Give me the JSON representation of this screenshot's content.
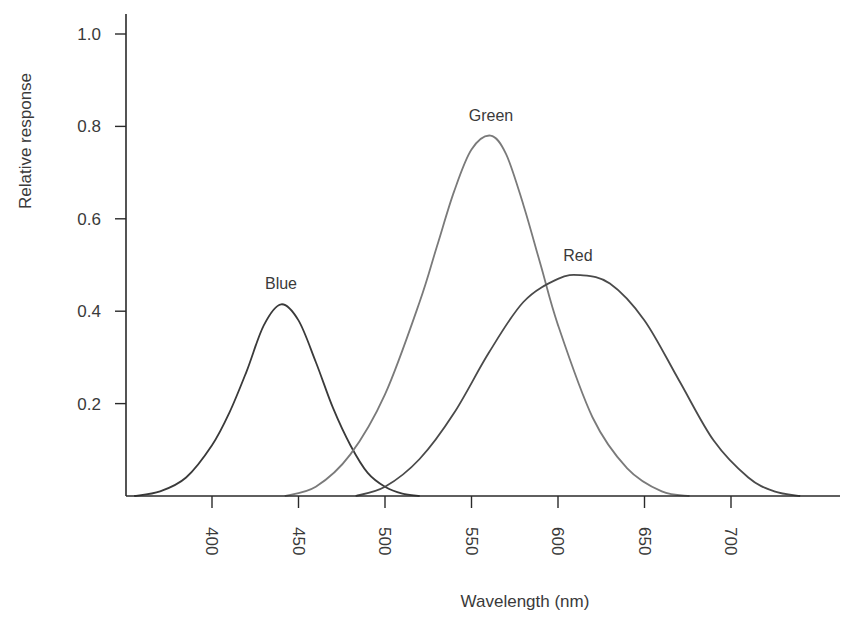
{
  "chart_data": {
    "type": "line",
    "title": "",
    "xlabel": "Wavelength (nm)",
    "ylabel": "Relative response",
    "xlim": [
      350,
      765
    ],
    "ylim": [
      0,
      1.05
    ],
    "grid": false,
    "legend": "inline labels",
    "x_ticks": [
      400,
      450,
      500,
      550,
      600,
      650,
      700
    ],
    "x_tick_labels": [
      "400",
      "450",
      "500",
      "550",
      "600",
      "650",
      "700"
    ],
    "y_ticks": [
      0.2,
      0.4,
      0.6,
      0.8,
      1.0
    ],
    "y_tick_labels": [
      "0.2",
      "0.4",
      "0.6",
      "0.8",
      "1.0"
    ],
    "series": [
      {
        "name": "Blue",
        "label": "Blue",
        "color": "#3a3a3a",
        "peak": {
          "x": 440,
          "y": 0.415
        },
        "x": [
          355,
          370,
          385,
          400,
          410,
          420,
          430,
          440,
          450,
          460,
          470,
          480,
          490,
          500,
          510,
          520
        ],
        "values": [
          0.0,
          0.01,
          0.04,
          0.11,
          0.18,
          0.27,
          0.37,
          0.415,
          0.38,
          0.29,
          0.19,
          0.11,
          0.05,
          0.02,
          0.005,
          0.0
        ]
      },
      {
        "name": "Green",
        "label": "Green",
        "color": "#7a7a7a",
        "peak": {
          "x": 561,
          "y": 0.78
        },
        "x": [
          442,
          460,
          480,
          500,
          520,
          530,
          540,
          550,
          561,
          570,
          580,
          590,
          600,
          620,
          640,
          660,
          676
        ],
        "values": [
          0.0,
          0.02,
          0.09,
          0.22,
          0.42,
          0.54,
          0.66,
          0.75,
          0.78,
          0.74,
          0.63,
          0.5,
          0.37,
          0.17,
          0.06,
          0.01,
          0.0
        ]
      },
      {
        "name": "Red",
        "label": "Red",
        "color": "#4a4a4a",
        "peak": {
          "x": 613,
          "y": 0.478
        },
        "x": [
          483,
          500,
          520,
          540,
          560,
          580,
          600,
          613,
          630,
          650,
          670,
          690,
          710,
          725,
          740
        ],
        "values": [
          0.0,
          0.02,
          0.08,
          0.18,
          0.31,
          0.42,
          0.47,
          0.478,
          0.46,
          0.38,
          0.25,
          0.12,
          0.04,
          0.01,
          0.0
        ]
      }
    ]
  }
}
